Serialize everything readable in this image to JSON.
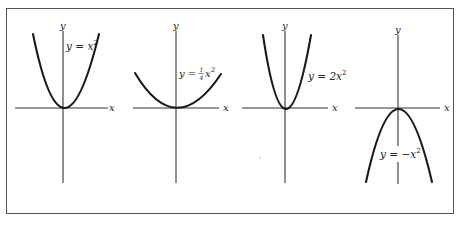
{
  "figure": {
    "panels": [
      {
        "id": "panel-1",
        "equation": "y = x²",
        "eq_parts": {
          "lhs": "y = x",
          "exp": "2"
        },
        "x_label": "x",
        "y_label": "y",
        "coefficient": 1,
        "opens": "up"
      },
      {
        "id": "panel-2",
        "equation": "y = ¼x²",
        "eq_parts": {
          "lhs": "y = ",
          "num": "1",
          "den": "4",
          "var": "x",
          "exp": "2"
        },
        "x_label": "x",
        "y_label": "y",
        "coefficient": 0.25,
        "opens": "up"
      },
      {
        "id": "panel-3",
        "equation": "y = 2x²",
        "eq_parts": {
          "lhs": "y = 2x",
          "exp": "2"
        },
        "x_label": "x",
        "y_label": "y",
        "coefficient": 2,
        "opens": "up"
      },
      {
        "id": "panel-4",
        "equation": "y = −x²",
        "eq_parts": {
          "lhs": "y = −x",
          "exp": "2"
        },
        "x_label": "x",
        "y_label": "y",
        "coefficient": -1,
        "opens": "down"
      }
    ]
  }
}
